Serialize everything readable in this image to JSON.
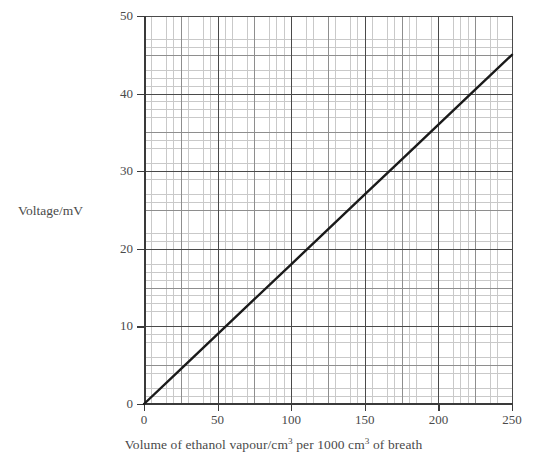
{
  "chart_data": {
    "type": "line",
    "title": "",
    "subtitle": "",
    "xlabel_parts": {
      "a": "Volume of ethanol vapour/cm",
      "sup1": "3",
      "b": " per 1000 cm",
      "sup2": "3",
      "c": " of breath"
    },
    "xlabel": "Volume of ethanol vapour/cm3 per 1000 cm3 of breath",
    "ylabel": "Voltage/mV",
    "xlim": [
      0,
      250
    ],
    "ylim": [
      0,
      50
    ],
    "xticks": [
      0,
      50,
      100,
      150,
      200,
      250
    ],
    "yticks": [
      0,
      10,
      20,
      30,
      40,
      50
    ],
    "xtick_labels": [
      "0",
      "50",
      "100",
      "150",
      "200",
      "250"
    ],
    "ytick_labels": [
      "0",
      "10",
      "20",
      "30",
      "40",
      "50"
    ],
    "x_minor_step": 5,
    "y_minor_step": 1,
    "x_mid_step": 25,
    "y_mid_step": 5,
    "grid": true,
    "grid_style": "graph-paper",
    "legend": false,
    "legend_position": "none",
    "series": [
      {
        "name": "calibration line",
        "style": "straight-line",
        "color": "#1a1a1a",
        "line_width": 2.4,
        "markers": false,
        "x": [
          0,
          25,
          50,
          75,
          100,
          125,
          150,
          175,
          200,
          225,
          250
        ],
        "y": [
          0,
          4.5,
          9,
          13.5,
          18,
          22.5,
          27,
          31.5,
          36,
          40.5,
          45
        ],
        "slope": 0.18,
        "intercept": 0,
        "endpoints": {
          "start": [
            0,
            0
          ],
          "end": [
            250,
            45
          ]
        }
      }
    ],
    "annotations": []
  },
  "colors": {
    "background": "#ffffff",
    "axis": "#3a3a3a",
    "grid_major": "#4a4a4a",
    "grid_mid": "#8e8e8e",
    "grid_minor": "#c9c9c9",
    "text": "#4a4a4a",
    "series": "#1a1a1a"
  }
}
